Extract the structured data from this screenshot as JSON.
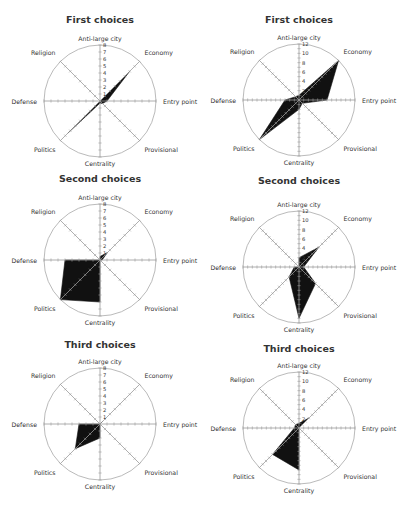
{
  "axes": [
    "Anti-large city",
    "Economy",
    "Entry point",
    "Provisional",
    "Centrality",
    "Politics",
    "Defense",
    "Religion"
  ],
  "colors": {
    "fill": "#111111",
    "axis": "#9a9a9a",
    "circle": "#a8a8a8",
    "text": "#333333"
  },
  "chart_data": [
    {
      "type": "radar",
      "title": "First choices",
      "position": "top-left",
      "rmax": 8,
      "ticks": [
        1,
        2,
        3,
        4,
        5,
        6,
        7,
        8
      ],
      "axes": [
        "Anti-large city",
        "Economy",
        "Entry point",
        "Provisional",
        "Centrality",
        "Politics",
        "Defense",
        "Religion"
      ],
      "values": [
        0,
        6,
        1,
        0.5,
        0.3,
        6.5,
        0,
        0
      ]
    },
    {
      "type": "radar",
      "title": "First choices",
      "position": "top-right",
      "rmax": 12,
      "ticks": [
        2,
        4,
        6,
        8,
        10,
        12
      ],
      "axes": [
        "Anti-large city",
        "Economy",
        "Entry point",
        "Provisional",
        "Centrality",
        "Politics",
        "Defense",
        "Religion"
      ],
      "values": [
        1,
        12,
        6,
        1,
        2,
        12,
        3,
        1
      ]
    },
    {
      "type": "radar",
      "title": "Second choices",
      "position": "middle-left",
      "rmax": 8,
      "ticks": [
        1,
        2,
        3,
        4,
        5,
        6,
        7,
        8
      ],
      "axes": [
        "Anti-large city",
        "Economy",
        "Entry point",
        "Provisional",
        "Centrality",
        "Politics",
        "Defense",
        "Religion"
      ],
      "values": [
        0.5,
        1.5,
        0.3,
        0,
        6,
        8,
        5,
        0
      ]
    },
    {
      "type": "radar",
      "title": "Second choices",
      "position": "middle-right",
      "rmax": 12,
      "ticks": [
        2,
        4,
        6,
        8,
        10,
        12
      ],
      "axes": [
        "Anti-large city",
        "Economy",
        "Entry point",
        "Provisional",
        "Centrality",
        "Politics",
        "Defense",
        "Religion"
      ],
      "values": [
        2,
        6,
        1,
        5,
        11,
        3,
        1,
        0
      ]
    },
    {
      "type": "radar",
      "title": "Third choices",
      "position": "bottom-left",
      "rmax": 8,
      "ticks": [
        1,
        2,
        3,
        4,
        5,
        6,
        7,
        8
      ],
      "axes": [
        "Anti-large city",
        "Economy",
        "Entry point",
        "Provisional",
        "Centrality",
        "Politics",
        "Defense",
        "Religion"
      ],
      "values": [
        0,
        0.5,
        0,
        0,
        2,
        5,
        3,
        0
      ]
    },
    {
      "type": "radar",
      "title": "Third choices",
      "position": "bottom-right",
      "rmax": 12,
      "ticks": [
        2,
        4,
        6,
        8,
        10,
        12
      ],
      "axes": [
        "Anti-large city",
        "Economy",
        "Entry point",
        "Provisional",
        "Centrality",
        "Politics",
        "Defense",
        "Religion"
      ],
      "values": [
        1,
        3,
        0,
        0,
        9,
        8,
        1,
        1
      ]
    }
  ]
}
